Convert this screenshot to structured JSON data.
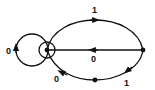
{
  "diagram": {
    "type": "state-transition-graph",
    "colors": {
      "stroke": "#111111",
      "background": "#ffffff"
    },
    "nodes": [
      {
        "id": "A",
        "role": "start/accepting (circled)"
      },
      {
        "id": "B",
        "role": "right node"
      },
      {
        "id": "C",
        "role": "bottom node"
      }
    ],
    "edges": [
      {
        "from": "A",
        "to": "A",
        "label": "0",
        "shape": "self-loop"
      },
      {
        "from": "A",
        "to": "B",
        "label": "1",
        "shape": "upper-arc"
      },
      {
        "from": "B",
        "to": "A",
        "label": "0",
        "shape": "straight"
      },
      {
        "from": "B",
        "to": "C",
        "label": "1",
        "shape": "lower-arc"
      },
      {
        "from": "C",
        "to": "A",
        "label": "0",
        "shape": "lower-arc"
      }
    ],
    "labels": {
      "self_loop": "0",
      "top_arc": "1",
      "middle_line": "0",
      "bottom_right_arc": "1",
      "bottom_left_arc": "0"
    }
  }
}
